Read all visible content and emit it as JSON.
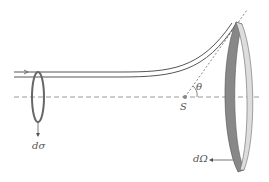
{
  "diagram": {
    "type": "scattering-cross-section",
    "labels": {
      "dsigma": "dσ",
      "center": "S",
      "angle": "θ",
      "domega": "dΩ"
    },
    "colors": {
      "line": "#555555",
      "axis": "#999999",
      "ring_dark": "#777777",
      "ring_light": "#cccccc"
    }
  }
}
